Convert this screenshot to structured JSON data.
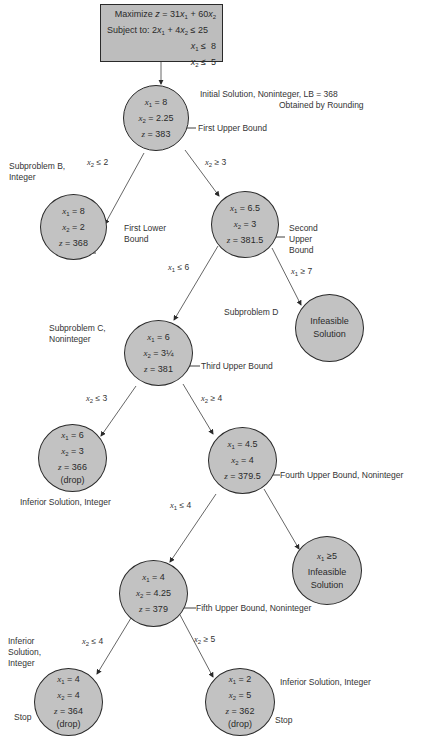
{
  "problem": {
    "objective": "Maximize z = 31x1 + 60x2",
    "objective_prefix": "Maximize",
    "subject_to_label": "Subject to:",
    "constraints": [
      "2x1 + 4x2 ≤ 25",
      "x1 ≤ 8",
      "x2 ≤ 5"
    ]
  },
  "nodes": [
    {
      "id": "A",
      "x1": "x1 = 8",
      "x2": "x2 = 2.25",
      "z": "z = 383",
      "annotation": "First Upper Bound",
      "title": "Initial Solution, Noninteger, LB = 368",
      "subtitle": "Obtained by Rounding"
    },
    {
      "id": "B",
      "x1": "x1 = 8",
      "x2": "x2 = 2",
      "z": "z = 368",
      "annotation": "First Lower Bound",
      "title": "Subproblem B, Integer",
      "branch": "x2 ≤ 2"
    },
    {
      "id": "B2",
      "x1": "x1 = 6.5",
      "x2": "x2 = 3",
      "z": "z = 381.5",
      "annotation": "Second Upper Bound",
      "branch": "x2 ≥ 3"
    },
    {
      "id": "C",
      "x1": "x1 = 6",
      "x2": "x2 = 3¼",
      "z": "z = 381",
      "annotation": "Third Upper Bound",
      "title": "Subproblem C, Noninteger",
      "branch": "x1 ≤ 6"
    },
    {
      "id": "D",
      "text1": "Infeasible",
      "text2": "Solution",
      "title": "Subproblem D",
      "branch": "x1 ≥ 7"
    },
    {
      "id": "E",
      "x1": "x1 = 6",
      "x2": "x2 = 3",
      "z": "z = 366",
      "drop": "(drop)",
      "title": "Inferior Solution, Integer",
      "branch": "x2 ≤ 3"
    },
    {
      "id": "F",
      "x1": "x1 = 4.5",
      "x2": "x2 = 4",
      "z": "z = 379.5",
      "annotation": "Fourth Upper Bound, Noninteger",
      "branch": "x2 ≥ 4"
    },
    {
      "id": "G",
      "x1": "x1 = 4",
      "x2": "x2 = 4.25",
      "z": "z = 379",
      "annotation": "Fifth Upper Bound, Noninteger",
      "branch": "x1 ≤ 4"
    },
    {
      "id": "H",
      "cond": "x1 ≥ 5",
      "text1": "Infeasible",
      "text2": "Solution",
      "branch": "x1 ≥ 5"
    },
    {
      "id": "I",
      "x1": "x1 = 4",
      "x2": "x2 = 4",
      "z": "z = 364",
      "drop": "(drop)",
      "title": "Inferior Solution, Integer",
      "stop": "Stop",
      "branch": "x2 ≤ 4"
    },
    {
      "id": "J",
      "x1": "x1 = 2",
      "x2": "x2 = 5",
      "z": "z = 362",
      "drop": "(drop)",
      "title": "Inferior Solution, Integer",
      "stop": "Stop",
      "branch": "x2 ≥ 5"
    }
  ],
  "labels": {
    "sub_b_1": "Subproblem B,",
    "sub_b_2": "Integer",
    "sub_c_1": "Subproblem C,",
    "sub_c_2": "Noninteger",
    "first_lower_1": "First Lower",
    "first_lower_2": "Bound",
    "second_upper_1": "Second",
    "second_upper_2": "Upper",
    "second_upper_3": "Bound",
    "inferior_i_1": "Inferior",
    "inferior_i_2": "Solution,",
    "inferior_i_3": "Integer"
  },
  "colors": {
    "node_fill": "#c2c2c2",
    "box_fill": "#bdbdbd",
    "stroke": "#2a2a2a",
    "line": "#555555"
  }
}
